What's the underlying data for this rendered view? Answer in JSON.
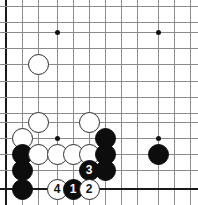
{
  "app": {
    "title": "Go Board Diagram",
    "board_type": "go-board-corner-diagram"
  },
  "board": {
    "colors": {
      "background": "#ffffff",
      "grid_line": "#8a8a8a",
      "border_line": "#1a1a1a",
      "black_stone": "#0d0d0d",
      "white_stone": "#ffffff",
      "white_stone_outline": "#2b2b2b",
      "star_point": "#111111"
    },
    "geometry": {
      "width": 198,
      "height": 205,
      "spacing": 16.1,
      "stone_diameter": 21,
      "x_coords": [
        6,
        22,
        38,
        57,
        73,
        89,
        105,
        121,
        137,
        158,
        174,
        190
      ],
      "y_coords": [
        6,
        22,
        32,
        48,
        64,
        81,
        97,
        113,
        122,
        138,
        154,
        170,
        189
      ]
    },
    "edges": {
      "left": "thick",
      "bottom": "thick",
      "top": "cropped",
      "right": "cropped"
    },
    "star_points": [
      {
        "name": "star-point-upper-left",
        "x": 57,
        "y": 32
      },
      {
        "name": "star-point-upper-right",
        "x": 158,
        "y": 32
      },
      {
        "name": "star-point-lower-left",
        "x": 57,
        "y": 138
      },
      {
        "name": "star-point-lower-right",
        "x": 158,
        "y": 138
      }
    ],
    "grid_lines": {
      "vertical": [
        {
          "x": 6,
          "edge": true
        },
        {
          "x": 22,
          "edge": false
        },
        {
          "x": 38,
          "edge": false
        },
        {
          "x": 57,
          "edge": false
        },
        {
          "x": 73,
          "edge": false
        },
        {
          "x": 89,
          "edge": false
        },
        {
          "x": 105,
          "edge": false
        },
        {
          "x": 121,
          "edge": false
        },
        {
          "x": 137,
          "edge": false
        },
        {
          "x": 158,
          "edge": false
        },
        {
          "x": 174,
          "edge": false
        },
        {
          "x": 190,
          "edge": false
        }
      ],
      "horizontal": [
        {
          "y": 6,
          "edge": false
        },
        {
          "y": 22,
          "edge": false
        },
        {
          "y": 32,
          "edge": false
        },
        {
          "y": 48,
          "edge": false
        },
        {
          "y": 64,
          "edge": false
        },
        {
          "y": 81,
          "edge": false
        },
        {
          "y": 97,
          "edge": false
        },
        {
          "y": 113,
          "edge": false
        },
        {
          "y": 122,
          "edge": false
        },
        {
          "y": 138,
          "edge": false
        },
        {
          "y": 154,
          "edge": false
        },
        {
          "y": 170,
          "edge": false
        },
        {
          "y": 189,
          "edge": true
        }
      ]
    },
    "stones": [
      {
        "name": "white-stone-upper-left-area",
        "color": "white",
        "x": 38,
        "y": 64,
        "label": ""
      },
      {
        "name": "white-stone-left-mid",
        "color": "white",
        "x": 38,
        "y": 122,
        "label": ""
      },
      {
        "name": "white-stone-center-mid",
        "color": "white",
        "x": 89,
        "y": 122,
        "label": ""
      },
      {
        "name": "white-stone-left-edge-upper",
        "color": "white",
        "x": 22,
        "y": 138,
        "label": ""
      },
      {
        "name": "black-stone-left-col-1",
        "color": "black",
        "x": 22,
        "y": 154,
        "label": ""
      },
      {
        "name": "black-stone-left-col-2",
        "color": "black",
        "x": 22,
        "y": 170,
        "label": ""
      },
      {
        "name": "black-stone-left-col-3",
        "color": "black",
        "x": 22,
        "y": 189,
        "label": ""
      },
      {
        "name": "white-stone-row-1",
        "color": "white",
        "x": 38,
        "y": 154,
        "label": ""
      },
      {
        "name": "white-stone-row-2",
        "color": "white",
        "x": 57,
        "y": 154,
        "label": ""
      },
      {
        "name": "white-stone-row-3",
        "color": "white",
        "x": 73,
        "y": 154,
        "label": ""
      },
      {
        "name": "white-stone-row-4",
        "color": "white",
        "x": 89,
        "y": 154,
        "label": ""
      },
      {
        "name": "black-stone-right-col-1",
        "color": "black",
        "x": 105,
        "y": 138,
        "label": ""
      },
      {
        "name": "black-stone-right-col-2",
        "color": "black",
        "x": 105,
        "y": 154,
        "label": ""
      },
      {
        "name": "black-stone-right-col-3",
        "color": "black",
        "x": 105,
        "y": 170,
        "label": ""
      },
      {
        "name": "black-stone-isolated-right",
        "color": "black",
        "x": 158,
        "y": 154,
        "label": ""
      },
      {
        "name": "move-3-black-stone",
        "color": "black",
        "x": 89,
        "y": 170,
        "label": "3"
      },
      {
        "name": "move-4-white-stone",
        "color": "white",
        "x": 57,
        "y": 189,
        "label": "4"
      },
      {
        "name": "move-1-black-stone",
        "color": "black",
        "x": 73,
        "y": 189,
        "label": "1"
      },
      {
        "name": "move-2-white-stone",
        "color": "white",
        "x": 89,
        "y": 189,
        "label": "2"
      }
    ]
  }
}
